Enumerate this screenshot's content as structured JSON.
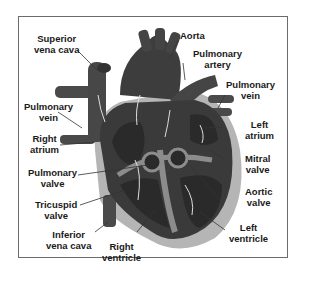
{
  "diagram": {
    "colors": {
      "heart": "#3a3a3a",
      "vessel": "#4a4a4a",
      "chamber_dark": "#2a2a2a",
      "septum": "#8c8c8c",
      "pericardium": "#b5b5b5",
      "leader_line": "#333333",
      "border": "#6b6b6b"
    },
    "labels": {
      "superior_vena_cava": [
        "Superior",
        "vena cava"
      ],
      "aorta": [
        "Aorta"
      ],
      "pulmonary_artery": [
        "Pulmonary",
        "artery"
      ],
      "pulmonary_vein_right": [
        "Pulmonary",
        "vein"
      ],
      "pulmonary_vein_left": [
        "Pulmonary",
        "vein"
      ],
      "left_atrium": [
        "Left",
        "atrium"
      ],
      "right_atrium": [
        "Right",
        "atrium"
      ],
      "mitral_valve": [
        "Mitral",
        "valve"
      ],
      "pulmonary_valve": [
        "Pulmonary",
        "valve"
      ],
      "aortic_valve": [
        "Aortic",
        "valve"
      ],
      "tricuspid_valve": [
        "Tricuspid",
        "valve"
      ],
      "inferior_vena_cava": [
        "Inferior",
        "vena cava"
      ],
      "right_ventricle": [
        "Right",
        "ventricle"
      ],
      "left_ventricle": [
        "Left",
        "ventricle"
      ]
    }
  }
}
